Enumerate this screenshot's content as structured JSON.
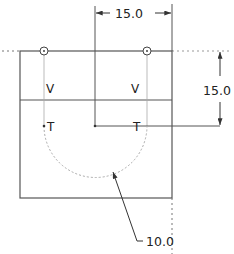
{
  "drawing": {
    "dimensions": {
      "horizontal_top": "15.0",
      "vertical_right": "15.0",
      "radius": "10.0"
    },
    "labels": {
      "v_left": "V",
      "v_right": "V",
      "t_left": "T",
      "t_right": "T"
    },
    "colors": {
      "line": "#555555",
      "construction": "#999999",
      "text": "#222222"
    }
  }
}
